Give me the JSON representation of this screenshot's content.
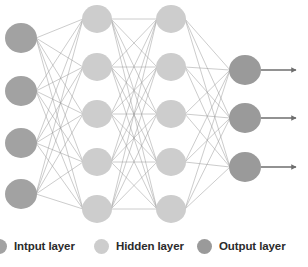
{
  "figure": {
    "title_partial_top": "",
    "background": "#ffffff"
  },
  "colors": {
    "input_node": "#a2a2a2",
    "hidden_node": "#cdcdcd",
    "output_node": "#9a9a9a",
    "edge": "#9b9b9b",
    "arrow": "#6e6e6e",
    "legend_text": "#2b2b2b"
  },
  "legend": {
    "items": [
      {
        "label": "Intput layer",
        "color": "#a2a2a2",
        "name": "input-layer"
      },
      {
        "label": "Hidden layer",
        "color": "#cdcdcd",
        "name": "hidden-layer"
      },
      {
        "label": "Output layer",
        "color": "#9a9a9a",
        "name": "output-layer"
      }
    ]
  },
  "chart_data": {
    "type": "diagram",
    "diagram_kind": "feedforward-neural-network",
    "title": "",
    "layers": [
      {
        "name": "Intput layer",
        "role": "input",
        "count": 4,
        "color": "#a2a2a2",
        "radius": 16,
        "cx": 21,
        "cy": [
          38,
          91,
          143,
          194
        ]
      },
      {
        "name": "Hidden layer 1",
        "role": "hidden",
        "count": 5,
        "color": "#cdcdcd",
        "radius": 15,
        "cx": 97,
        "cy": [
          19,
          67,
          114,
          162,
          209
        ]
      },
      {
        "name": "Hidden layer 2",
        "role": "hidden",
        "count": 5,
        "color": "#cdcdcd",
        "radius": 15,
        "cx": 171,
        "cy": [
          19,
          67,
          114,
          162,
          209
        ]
      },
      {
        "name": "Output layer",
        "role": "output",
        "count": 3,
        "color": "#9a9a9a",
        "radius": 16,
        "cx": 245,
        "cy": [
          70,
          118,
          167
        ]
      }
    ],
    "connections": "fully-connected between adjacent layers",
    "output_arrows": {
      "count": 3,
      "from_x": 261,
      "to_x": 296,
      "y": [
        70,
        118,
        167
      ]
    }
  }
}
